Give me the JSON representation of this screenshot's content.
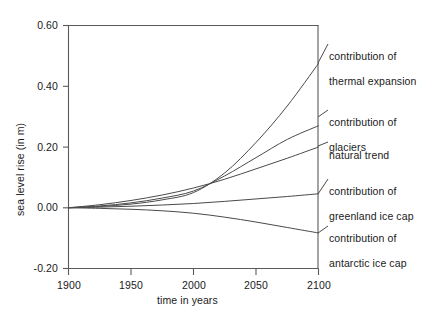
{
  "chart_data": {
    "type": "line",
    "title": "",
    "xlabel": "time in years",
    "ylabel": "sea level rise (in m)",
    "xlim": [
      1900,
      2100
    ],
    "ylim": [
      -0.2,
      0.6
    ],
    "xticks": [
      1900,
      1950,
      2000,
      2050,
      2100
    ],
    "xtick_labels": [
      "1900",
      "1950",
      "2000",
      "2050",
      "2100"
    ],
    "yticks": [
      -0.2,
      0.0,
      0.2,
      0.4,
      0.6
    ],
    "ytick_labels": [
      "-0.20",
      "0.00",
      "0.20",
      "0.40",
      "0.60"
    ],
    "grid": false,
    "legend_position": "right-outside-annotations",
    "x": [
      1900,
      1925,
      1950,
      1975,
      2000,
      2025,
      2050,
      2075,
      2100
    ],
    "series": [
      {
        "name": "contribution of thermal expansion",
        "label": "contribution of\nthermal expansion",
        "values": [
          0.0,
          0.004,
          0.012,
          0.026,
          0.05,
          0.115,
          0.215,
          0.335,
          0.475
        ]
      },
      {
        "name": "contribution of glaciers",
        "label": "contribution of\nglaciers",
        "values": [
          0.0,
          0.006,
          0.016,
          0.032,
          0.055,
          0.105,
          0.165,
          0.225,
          0.27
        ]
      },
      {
        "name": "natural trend",
        "label": "natural trend",
        "values": [
          0.0,
          0.01,
          0.024,
          0.042,
          0.065,
          0.094,
          0.128,
          0.163,
          0.2
        ]
      },
      {
        "name": "contribution of greenland ice cap",
        "label": "contribution of\ngreenland ice cap",
        "values": [
          0.0,
          0.002,
          0.005,
          0.009,
          0.014,
          0.021,
          0.029,
          0.037,
          0.046
        ]
      },
      {
        "name": "contribution of antarctic ice cap",
        "label": "contribution of\nantarctic ice cap",
        "values": [
          0.0,
          -0.002,
          -0.005,
          -0.01,
          -0.018,
          -0.031,
          -0.047,
          -0.065,
          -0.083
        ]
      }
    ]
  },
  "axes": {
    "ylabel": "sea level rise (in m)",
    "xlabel": "time in years",
    "ytick_0": "0.60",
    "ytick_1": "0.40",
    "ytick_2": "0.20",
    "ytick_3": "0.00",
    "ytick_4": "-0.20",
    "xtick_0": "1900",
    "xtick_1": "1950",
    "xtick_2": "2000",
    "xtick_3": "2050",
    "xtick_4": "2100"
  },
  "annotations": {
    "thermal_line1": "contribution of",
    "thermal_line2": "thermal expansion",
    "glaciers_line1": "contribution of",
    "glaciers_line2": "glaciers",
    "natural_line1": "natural trend",
    "greenland_line1": "contribution of",
    "greenland_line2": "greenland ice cap",
    "antarctic_line1": "contribution of",
    "antarctic_line2": "antarctic ice cap"
  },
  "colors": {
    "axis": "#5a5a5a",
    "curve": "#4a4a4a",
    "text": "#1a1a1a",
    "background": "#ffffff"
  }
}
